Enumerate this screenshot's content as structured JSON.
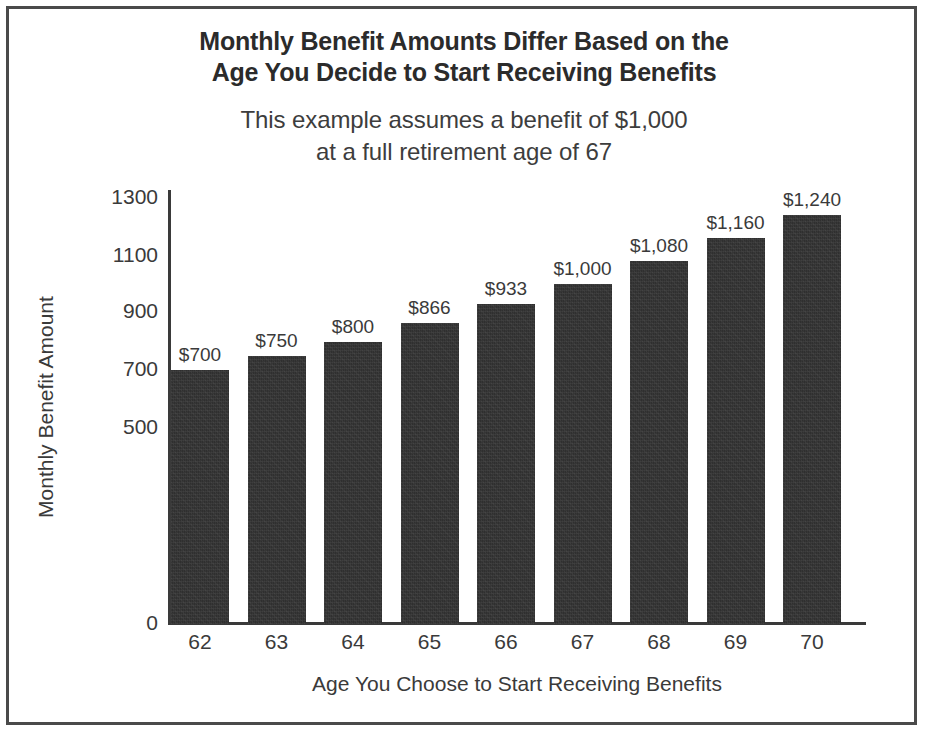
{
  "chart_data": {
    "type": "bar",
    "title": "Monthly Benefit Amounts Differ Based on the Age You Decide to Start Receiving Benefits",
    "title_lines": [
      "Monthly Benefit Amounts Differ Based on the",
      "Age You Decide to Start Receiving Benefits"
    ],
    "subtitle": "This example assumes a benefit of $1,000 at a full retirement age of 67",
    "subtitle_lines": [
      "This example assumes a benefit of $1,000",
      "at a full retirement age of 67"
    ],
    "xlabel": "Age You Choose to Start Receiving Benefits",
    "ylabel": "Monthly Benefit Amount",
    "categories": [
      "62",
      "63",
      "64",
      "65",
      "66",
      "67",
      "68",
      "69",
      "70"
    ],
    "values": [
      700,
      750,
      800,
      866,
      933,
      1000,
      1080,
      1160,
      1240
    ],
    "value_labels": [
      "$700",
      "$750",
      "$800",
      "$866",
      "$933",
      "$1,000",
      "$1,080",
      "$1,160",
      "$1,240"
    ],
    "ytick_labels": [
      "1300",
      "1100",
      "900",
      "700",
      "500",
      "0"
    ],
    "ytick_values": [
      1300,
      1100,
      900,
      700,
      500,
      0
    ],
    "ylim": [
      0,
      1300
    ],
    "grid": false,
    "legend": false,
    "bar_color": "#2f2f2f",
    "axis_color": "#3a3a3a",
    "text_color": "#3a3a3a",
    "background_color": "#ffffff",
    "frame_color": "#4a4a4a"
  }
}
